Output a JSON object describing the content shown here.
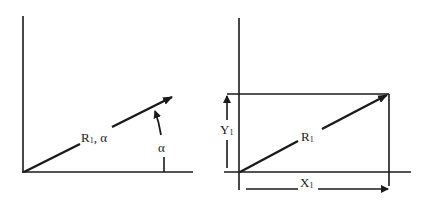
{
  "diagram": {
    "left_panel": {
      "description": "Polar form",
      "vector_label": {
        "main": "R",
        "sub": "1",
        "suffix": ", α"
      },
      "angle_label": "α"
    },
    "right_panel": {
      "description": "Rectangular components",
      "vector_label": {
        "main": "R",
        "sub": "1"
      },
      "x_component": {
        "main": "X",
        "sub": "1"
      },
      "y_component": {
        "main": "Y",
        "sub": "1"
      }
    },
    "colors": {
      "ink": "#1a1a1a",
      "background": "#ffffff"
    }
  }
}
